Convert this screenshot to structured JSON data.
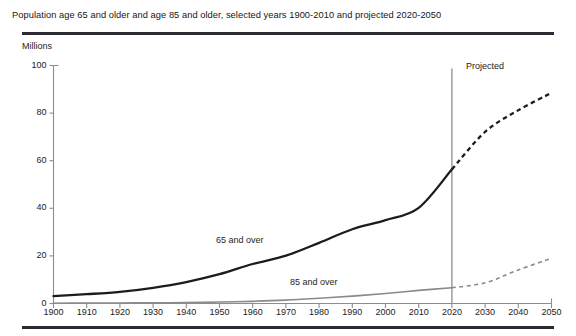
{
  "figure": {
    "title": "Population age 65 and older and age 85 and older, selected years 1900-2010 and projected 2020-2050",
    "unit_label": "Millions",
    "projected_label": "Projected",
    "series_label_65": "65 and over",
    "series_label_85": "85 and over"
  },
  "chart_data": {
    "type": "line",
    "title": "Population age 65 and older and age 85 and older, selected years 1900-2010 and projected 2020-2050",
    "xlabel": "",
    "ylabel": "Millions",
    "ylim": [
      0,
      100
    ],
    "xlim": [
      1900,
      2050
    ],
    "grid": false,
    "legend_position": "inline-annotation",
    "annotations": [
      "Projected",
      "65 and over",
      "85 and over"
    ],
    "projection_divider_year": 2020,
    "x": [
      1900,
      1910,
      1920,
      1930,
      1940,
      1950,
      1960,
      1970,
      1980,
      1990,
      2000,
      2010,
      2020,
      2030,
      2040,
      2050
    ],
    "yticks": [
      0,
      20,
      40,
      60,
      80,
      100
    ],
    "xticks": [
      1900,
      1910,
      1920,
      1930,
      1940,
      1950,
      1960,
      1970,
      1980,
      1990,
      2000,
      2010,
      2020,
      2030,
      2040,
      2050
    ],
    "series": [
      {
        "name": "65 and over",
        "color": "#1c1c1c",
        "actual_x": [
          1900,
          1910,
          1920,
          1930,
          1940,
          1950,
          1960,
          1970,
          1980,
          1990,
          2000,
          2010,
          2020
        ],
        "actual_values": [
          3.1,
          3.9,
          4.9,
          6.6,
          9.0,
          12.3,
          16.6,
          20.1,
          25.5,
          31.2,
          35.0,
          40.2,
          56.4
        ],
        "projected_x": [
          2020,
          2030,
          2040,
          2050
        ],
        "projected_values": [
          56.4,
          72.1,
          81.2,
          88.5
        ]
      },
      {
        "name": "85 and over",
        "color": "#8a8a8a",
        "actual_x": [
          1900,
          1910,
          1920,
          1930,
          1940,
          1950,
          1960,
          1970,
          1980,
          1990,
          2000,
          2010,
          2020
        ],
        "actual_values": [
          0.1,
          0.2,
          0.2,
          0.3,
          0.4,
          0.6,
          0.9,
          1.4,
          2.2,
          3.1,
          4.2,
          5.5,
          6.6
        ],
        "projected_x": [
          2020,
          2030,
          2040,
          2050
        ],
        "projected_values": [
          6.6,
          8.7,
          14.1,
          19.0
        ]
      }
    ]
  },
  "axis": {
    "ytick_labels": [
      "100",
      "80",
      "60",
      "40",
      "20",
      "0"
    ],
    "xtick_labels": [
      "1900",
      "1910",
      "1920",
      "1930",
      "1940",
      "1950",
      "1960",
      "1970",
      "1980",
      "1990",
      "2000",
      "2010",
      "2020",
      "2030",
      "2040",
      "2050"
    ]
  },
  "colors": {
    "rule": "#2b2b33",
    "axis": "#8d8d8d",
    "series_65": "#1c1c1c",
    "series_85": "#8a8a8a",
    "divider": "#8d8d8d"
  }
}
